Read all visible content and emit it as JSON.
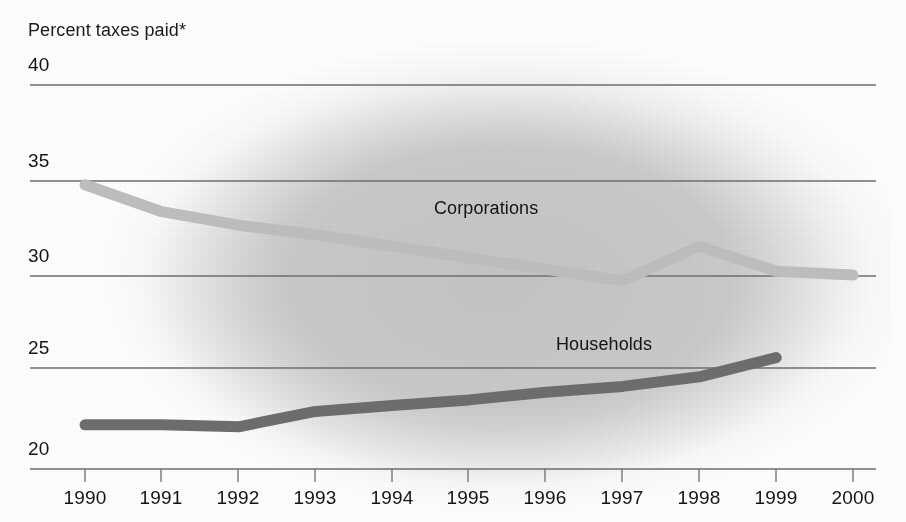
{
  "chart_data": {
    "type": "line",
    "title": "Percent taxes paid*",
    "xlabel": "",
    "ylabel": "Percent taxes paid*",
    "categories": [
      "1990",
      "1991",
      "1992",
      "1993",
      "1994",
      "1995",
      "1996",
      "1997",
      "1998",
      "1999",
      "2000"
    ],
    "x": [
      1990,
      1991,
      1992,
      1993,
      1994,
      1995,
      1996,
      1997,
      1998,
      1999,
      2000
    ],
    "ylim": [
      20,
      40
    ],
    "xlim": [
      1990,
      2000
    ],
    "yticks": [
      20,
      25,
      30,
      35,
      40
    ],
    "ytick_labels": [
      "20",
      "25",
      "30",
      "35",
      "40"
    ],
    "grid": true,
    "grid_axis": "y",
    "legend": "inline-labels",
    "series": [
      {
        "name": "Corporations",
        "color": "#bfbfbf",
        "values": [
          34.8,
          33.4,
          32.7,
          32.2,
          31.6,
          31.0,
          30.4,
          29.8,
          31.6,
          30.3,
          30.1
        ],
        "label_position": {
          "x": 434,
          "y": 198
        }
      },
      {
        "name": "Households",
        "color": "#6e6e6e",
        "values": [
          22.3,
          22.3,
          22.2,
          23.0,
          23.3,
          23.6,
          24.0,
          24.3,
          24.8,
          25.8,
          null
        ],
        "label_position": {
          "x": 556,
          "y": 334
        }
      }
    ],
    "annotations": [
      "*"
    ],
    "footnote_marker": "*"
  },
  "labels": {
    "title": "Percent taxes paid*",
    "series_corporations": "Corporations",
    "series_households": "Households",
    "y_40": "40",
    "y_35": "35",
    "y_30": "30",
    "y_25": "25",
    "y_20": "20",
    "x_1990": "1990",
    "x_1991": "1991",
    "x_1992": "1992",
    "x_1993": "1993",
    "x_1994": "1994",
    "x_1995": "1995",
    "x_1996": "1996",
    "x_1997": "1997",
    "x_1998": "1998",
    "x_1999": "1999",
    "x_2000": "2000"
  },
  "colors": {
    "corporations": "#bfbfbf",
    "households": "#6e6e6e",
    "gridline": "#6f6f6f",
    "text": "#141414",
    "background": "#ffffff"
  }
}
